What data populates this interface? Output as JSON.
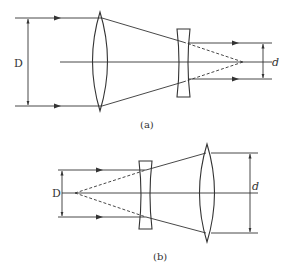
{
  "figure": {
    "panels": [
      {
        "id": "a",
        "caption": "(a)",
        "input_label": "D",
        "output_label": "d",
        "elements": [
          "convex-lens",
          "concave-lens",
          "optical-axis"
        ],
        "description": "Beam reducer: parallel beam of width D enters convex lens, converges, concave lens outputs parallel beam of width d; dashed extensions meet at focal point"
      },
      {
        "id": "b",
        "caption": "(b)",
        "input_label": "D",
        "output_label": "d",
        "elements": [
          "concave-lens",
          "convex-lens",
          "optical-axis"
        ],
        "description": "Beam expander: parallel beam of width D enters concave lens, diverges from virtual focal point, convex lens outputs parallel beam of width d"
      }
    ],
    "colors": {
      "line": "#333333",
      "background": "#ffffff"
    }
  }
}
